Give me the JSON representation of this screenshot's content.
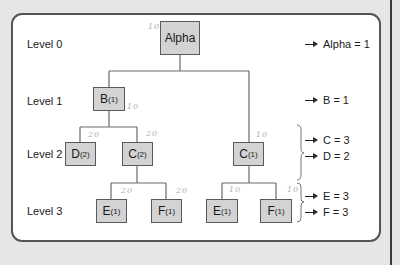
{
  "diagram": {
    "levels": [
      "Level 0",
      "Level 1",
      "Level 2",
      "Level 3"
    ],
    "nodes": {
      "alpha": {
        "label": "Alpha",
        "sub": ""
      },
      "b": {
        "label": "B",
        "sub": "(1)"
      },
      "d": {
        "label": "D",
        "sub": "(2)"
      },
      "c2": {
        "label": "C",
        "sub": "(2)"
      },
      "c1": {
        "label": "C",
        "sub": "(1)"
      },
      "e_left": {
        "label": "E",
        "sub": "(1)"
      },
      "f_left": {
        "label": "F",
        "sub": "(1)"
      },
      "e_right": {
        "label": "E",
        "sub": "(1)"
      },
      "f_right": {
        "label": "F",
        "sub": "(1)"
      }
    },
    "results": [
      "Alpha = 1",
      "B = 1",
      "C = 3",
      "D = 2",
      "E = 3",
      "F = 3"
    ],
    "handwritten_marks": {
      "alpha": "10",
      "b": "10",
      "d": "20",
      "c2": "20",
      "c1": "10",
      "e_left": "20",
      "f_left": "20",
      "e_right": "10",
      "f_right": "10"
    },
    "colors": {
      "node_fill": "#d3d3d3",
      "node_border": "#5a5a5a",
      "panel_border": "#555555",
      "background": "#e6e6e4"
    }
  }
}
